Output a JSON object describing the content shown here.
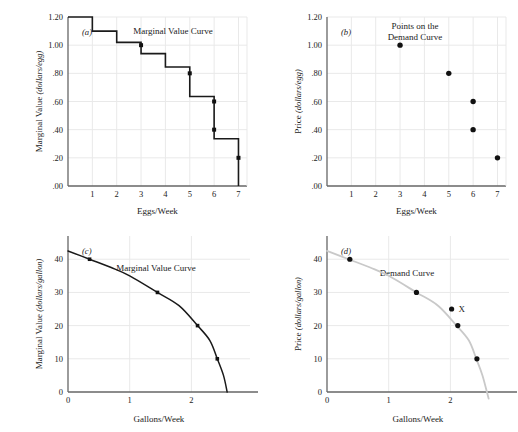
{
  "figure": {
    "background_color": "#ffffff",
    "grid_color": "#e9e9e9",
    "axis_color": "#666666",
    "curve_color": "#1a1a1a",
    "demand_curve_color": "#c9c9c9",
    "point_color": "#111111"
  },
  "panels": [
    {
      "id": "a",
      "label": "(a)",
      "annotation": [
        "Marginal Value Curve"
      ],
      "xlabel": "Eggs/Week",
      "ylabel": "Marginal Value (dollars/egg)",
      "ylabel_plain": "Marginal Value",
      "ylabel_italic": "(dollars/egg)",
      "xticks": [
        "1",
        "2",
        "3",
        "4",
        "5",
        "6",
        "7"
      ],
      "xtick_values": [
        1,
        2,
        3,
        4,
        5,
        6,
        7
      ],
      "yticks": [
        "1.20",
        "1.00",
        ".80",
        ".60",
        ".40",
        ".20",
        ".00"
      ],
      "ytick_values": [
        1.2,
        1.0,
        0.8,
        0.6,
        0.4,
        0.2,
        0.0
      ],
      "xlim": [
        0,
        7.35
      ],
      "ylim": [
        0,
        1.2
      ]
    },
    {
      "id": "b",
      "label": "(b)",
      "annotation": [
        "Points on the",
        "Demand Curve"
      ],
      "xlabel": "Eggs/Week",
      "ylabel": "Price (dollars/egg)",
      "ylabel_plain": "Price",
      "ylabel_italic": "(dollars/egg)",
      "xticks": [
        "1",
        "2",
        "3",
        "4",
        "5",
        "6",
        "7"
      ],
      "xtick_values": [
        1,
        2,
        3,
        4,
        5,
        6,
        7
      ],
      "yticks": [
        "1.20",
        "1.00",
        ".80",
        ".60",
        ".40",
        ".20",
        ".00"
      ],
      "ytick_values": [
        1.2,
        1.0,
        0.8,
        0.6,
        0.4,
        0.2,
        0.0
      ],
      "xlim": [
        0,
        7.35
      ],
      "ylim": [
        0,
        1.2
      ]
    },
    {
      "id": "c",
      "label": "(c)",
      "annotation": [
        "Marginal Value Curve"
      ],
      "xlabel": "Gallons/Week",
      "ylabel": "Marginal Value (dollars/gallon)",
      "ylabel_plain": "Marginal Value",
      "ylabel_italic": "(dollars/gallon)",
      "xticks": [
        "0",
        "1",
        "2"
      ],
      "xtick_values": [
        0,
        1,
        2
      ],
      "yticks": [
        "0",
        "10",
        "20",
        "30",
        "40"
      ],
      "ytick_values": [
        0,
        10,
        20,
        30,
        40
      ],
      "xlim": [
        0,
        2.95
      ],
      "ylim": [
        0,
        47
      ]
    },
    {
      "id": "d",
      "label": "(d)",
      "annotation": [
        "Demand Curve"
      ],
      "xlabel": "Gallons/Week",
      "ylabel": "Price (dollars/gallon)",
      "ylabel_plain": "Price",
      "ylabel_italic": "(dollars/gallon)",
      "xticks": [
        "0",
        "1",
        "2"
      ],
      "xtick_values": [
        0,
        1,
        2
      ],
      "yticks": [
        "0",
        "10",
        "20",
        "30",
        "40"
      ],
      "ytick_values": [
        0,
        10,
        20,
        30,
        40
      ],
      "xlim": [
        0,
        2.95
      ],
      "ylim": [
        0,
        47
      ],
      "point_marker_label": "X"
    }
  ],
  "chart_data": [
    {
      "type": "line",
      "panel": "a",
      "title": "Marginal Value Curve",
      "subtitle": "(a)",
      "xlabel": "Eggs/Week",
      "ylabel": "Marginal Value (dollars/egg)",
      "xlim": [
        0,
        7.35
      ],
      "ylim": [
        0,
        1.2
      ],
      "grid": true,
      "legend": "none",
      "style": "step",
      "step_levels": [
        {
          "x_from": 0,
          "x_to": 1,
          "value": 1.2
        },
        {
          "x_from": 1,
          "x_to": 2,
          "value": 1.1
        },
        {
          "x_from": 2,
          "x_to": 3,
          "value": 1.02
        },
        {
          "x_from": 3,
          "x_to": 4,
          "value": 0.94
        },
        {
          "x_from": 4,
          "x_to": 5,
          "value": 0.845
        },
        {
          "x_from": 5,
          "x_to": 6,
          "value": 0.635
        },
        {
          "x_from": 6,
          "x_to": 7,
          "value": 0.335
        }
      ],
      "marked_points": [
        {
          "x": 3,
          "y": 1.0
        },
        {
          "x": 5,
          "y": 0.8
        },
        {
          "x": 6,
          "y": 0.6
        },
        {
          "x": 6,
          "y": 0.4
        },
        {
          "x": 7,
          "y": 0.2
        }
      ]
    },
    {
      "type": "scatter",
      "panel": "b",
      "title": "Points on the Demand Curve",
      "subtitle": "(b)",
      "xlabel": "Eggs/Week",
      "ylabel": "Price (dollars/egg)",
      "xlim": [
        0,
        7.35
      ],
      "ylim": [
        0,
        1.2
      ],
      "grid": true,
      "legend": "none",
      "points": [
        {
          "x": 3,
          "y": 1.0
        },
        {
          "x": 5,
          "y": 0.8
        },
        {
          "x": 6,
          "y": 0.6
        },
        {
          "x": 6,
          "y": 0.4
        },
        {
          "x": 7,
          "y": 0.2
        }
      ]
    },
    {
      "type": "line",
      "panel": "c",
      "title": "Marginal Value Curve",
      "subtitle": "(c)",
      "xlabel": "Gallons/Week",
      "ylabel": "Marginal Value (dollars/gallon)",
      "xlim": [
        0,
        2.95
      ],
      "ylim": [
        0,
        47
      ],
      "grid": true,
      "legend": "none",
      "curve_description": "smooth concave decreasing curve from (0, 42.5) to (2.58, 0)",
      "curve_points": [
        {
          "x": 0.0,
          "y": 42.5
        },
        {
          "x": 0.35,
          "y": 40.0
        },
        {
          "x": 0.7,
          "y": 37.5
        },
        {
          "x": 1.0,
          "y": 35.0
        },
        {
          "x": 1.45,
          "y": 30.0
        },
        {
          "x": 1.8,
          "y": 26.0
        },
        {
          "x": 2.1,
          "y": 20.0
        },
        {
          "x": 2.3,
          "y": 15.5
        },
        {
          "x": 2.42,
          "y": 10.0
        },
        {
          "x": 2.52,
          "y": 5.0
        },
        {
          "x": 2.58,
          "y": 0.0
        }
      ],
      "marked_points": [
        {
          "x": 0.35,
          "y": 40
        },
        {
          "x": 1.45,
          "y": 30
        },
        {
          "x": 2.1,
          "y": 20
        },
        {
          "x": 2.42,
          "y": 10
        }
      ]
    },
    {
      "type": "scatter",
      "panel": "d",
      "title": "Demand Curve",
      "subtitle": "(d)",
      "xlabel": "Gallons/Week",
      "ylabel": "Price (dollars/gallon)",
      "xlim": [
        0,
        2.95
      ],
      "ylim": [
        0,
        47
      ],
      "grid": true,
      "legend": "none",
      "curve_description": "light gray smooth concave decreasing demand curve",
      "curve_points": [
        {
          "x": 0.0,
          "y": 42.5
        },
        {
          "x": 0.35,
          "y": 40.0
        },
        {
          "x": 0.7,
          "y": 37.5
        },
        {
          "x": 1.0,
          "y": 35.0
        },
        {
          "x": 1.45,
          "y": 30.0
        },
        {
          "x": 1.8,
          "y": 26.0
        },
        {
          "x": 2.1,
          "y": 20.0
        },
        {
          "x": 2.3,
          "y": 15.5
        },
        {
          "x": 2.42,
          "y": 10.0
        },
        {
          "x": 2.52,
          "y": 5.0
        },
        {
          "x": 2.62,
          "y": -2.0
        }
      ],
      "points": [
        {
          "x": 0.37,
          "y": 40
        },
        {
          "x": 1.45,
          "y": 30
        },
        {
          "x": 2.02,
          "y": 25,
          "label": "X"
        },
        {
          "x": 2.12,
          "y": 20
        },
        {
          "x": 2.43,
          "y": 10
        }
      ]
    }
  ]
}
